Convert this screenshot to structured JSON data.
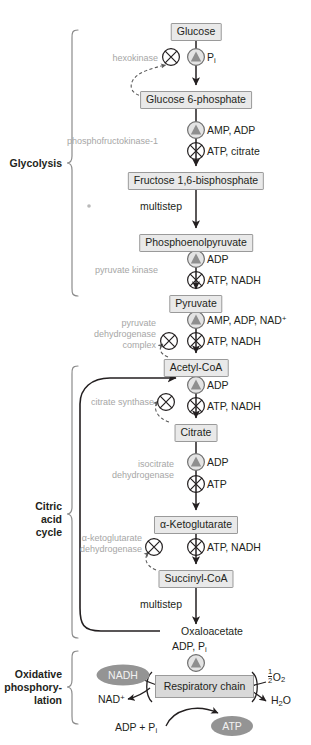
{
  "figure": {
    "symbol_legend": {
      "activation": "filled-triangle-in-circle",
      "inhibition": "x-in-circle"
    },
    "colors": {
      "box_fill": "#e9e9e9",
      "box_border": "#9a9a9a",
      "oval_fill": "#949494",
      "oval_text": "#f2f2f2",
      "enzyme_text": "#a6a6a6",
      "arrow": "#231f20",
      "respiratory_chain_fill": "#d9d9d9"
    }
  },
  "sections": [
    {
      "id": "glycolysis",
      "label": "Glycolysis",
      "lines": [
        "Glycolysis"
      ]
    },
    {
      "id": "citric-acid-cycle",
      "label": "Citric acid cycle",
      "lines": [
        "Citric",
        "acid",
        "cycle"
      ]
    },
    {
      "id": "oxidative-phosphorylation",
      "label": "Oxidative phosphorylation",
      "lines": [
        "Oxidative",
        "phosphory-",
        "lation"
      ]
    }
  ],
  "metabolites": [
    {
      "id": "glucose",
      "name": "Glucose",
      "boxed": true
    },
    {
      "id": "glucose-6-phosphate",
      "name": "Glucose 6-phosphate",
      "boxed": true
    },
    {
      "id": "fructose-1-6-bisphosphate",
      "name": "Fructose 1,6-bisphosphate",
      "boxed": true
    },
    {
      "id": "phosphoenolpyruvate",
      "name": "Phosphoenolpyruvate",
      "boxed": true
    },
    {
      "id": "pyruvate",
      "name": "Pyruvate",
      "boxed": true
    },
    {
      "id": "acetyl-coa",
      "name": "Acetyl-CoA",
      "boxed": true
    },
    {
      "id": "citrate",
      "name": "Citrate",
      "boxed": true
    },
    {
      "id": "alpha-ketoglutarate",
      "name": "α-Ketoglutarate",
      "boxed": true
    },
    {
      "id": "succinyl-coa",
      "name": "Succinyl-CoA",
      "boxed": true
    },
    {
      "id": "oxaloacetate",
      "name": "Oxaloacetate",
      "boxed": false
    }
  ],
  "enzymes": [
    {
      "id": "hexokinase",
      "lines": [
        "hexokinase"
      ]
    },
    {
      "id": "phosphofructokinase-1",
      "lines": [
        "phosphofructokinase-1"
      ]
    },
    {
      "id": "pyruvate-kinase",
      "lines": [
        "pyruvate kinase"
      ]
    },
    {
      "id": "pyruvate-dehydrogenase-complex",
      "lines": [
        "pyruvate",
        "dehydrogenase",
        "complex"
      ]
    },
    {
      "id": "citrate-synthase",
      "lines": [
        "citrate synthase"
      ]
    },
    {
      "id": "isocitrate-dehydrogenase",
      "lines": [
        "isocitrate",
        "dehydrogenase"
      ]
    },
    {
      "id": "alpha-ketoglutarate-dehydrogenase",
      "lines": [
        "α-ketoglutarate",
        "dehydrogenase"
      ]
    }
  ],
  "multistep_labels": [
    {
      "id": "multistep-glycolysis",
      "text": "multistep"
    },
    {
      "id": "multistep-citric-acid-cycle",
      "text": "multistep"
    }
  ],
  "effectors": [
    {
      "id": "pi-activator-glucose",
      "type": "activation",
      "label": "P",
      "sub": "i",
      "raw": "Pi"
    },
    {
      "id": "amp-adp-activator-pfk1",
      "type": "activation",
      "label": "AMP, ADP",
      "raw": "AMP, ADP"
    },
    {
      "id": "atp-citrate-inhibitor-pfk1",
      "type": "inhibition",
      "label": "ATP, citrate",
      "raw": "ATP, citrate"
    },
    {
      "id": "adp-activator-pyruvate-kinase",
      "type": "activation",
      "label": "ADP",
      "raw": "ADP"
    },
    {
      "id": "atp-nadh-inhibitor-pyruvate-kinase",
      "type": "inhibition",
      "label": "ATP, NADH",
      "raw": "ATP, NADH"
    },
    {
      "id": "amp-adp-nad-activator-pdh",
      "type": "activation",
      "label": "AMP, ADP, NAD",
      "sup": "+",
      "raw": "AMP, ADP, NAD+"
    },
    {
      "id": "atp-nadh-inhibitor-pdh",
      "type": "inhibition",
      "label": "ATP, NADH",
      "raw": "ATP, NADH"
    },
    {
      "id": "adp-activator-citrate-synthase",
      "type": "activation",
      "label": "ADP",
      "raw": "ADP"
    },
    {
      "id": "atp-nadh-inhibitor-citrate-synthase",
      "type": "inhibition",
      "label": "ATP, NADH",
      "raw": "ATP, NADH"
    },
    {
      "id": "adp-activator-isocitrate-dh",
      "type": "activation",
      "label": "ADP",
      "raw": "ADP"
    },
    {
      "id": "atp-inhibitor-isocitrate-dh",
      "type": "inhibition",
      "label": "ATP",
      "raw": "ATP"
    },
    {
      "id": "atp-nadh-inhibitor-akg-dh",
      "type": "inhibition",
      "label": "ATP, NADH",
      "raw": "ATP, NADH"
    }
  ],
  "oxidative_phosphorylation": {
    "respiratory_chain": "Respiratory chain",
    "adp_pi_top": {
      "label": "ADP, P",
      "sub": "i",
      "raw": "ADP, Pi"
    },
    "nadh": "NADH",
    "nad_plus": {
      "label": "NAD",
      "sup": "+",
      "raw": "NAD+"
    },
    "oxygen": {
      "numerator": "1",
      "denominator": "2",
      "label": "O",
      "sub": "2",
      "raw": "1/2 O2"
    },
    "water": {
      "label": "H",
      "sub": "2",
      "label2": "O",
      "raw": "H2O"
    },
    "adp_plus_pi": {
      "label": "ADP + P",
      "sub": "i",
      "raw": "ADP + Pi"
    },
    "atp": "ATP"
  }
}
